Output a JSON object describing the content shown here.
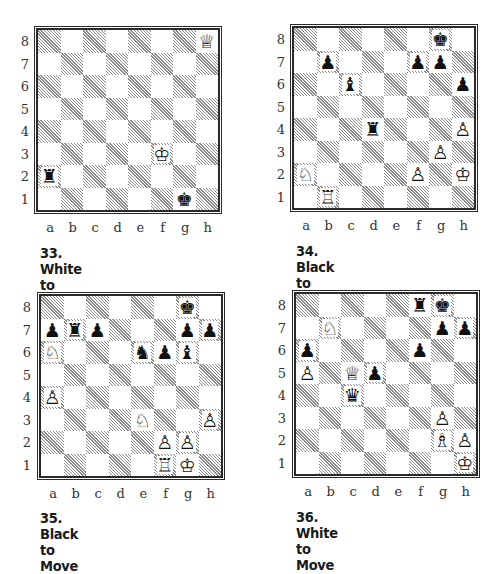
{
  "file_labels": [
    "a",
    "b",
    "c",
    "d",
    "e",
    "f",
    "g",
    "h"
  ],
  "rank_labels": [
    "8",
    "7",
    "6",
    "5",
    "4",
    "3",
    "2",
    "1"
  ],
  "diagrams": [
    {
      "number": "33",
      "caption": "33. White to Move",
      "to_move": "White",
      "pieces": [
        {
          "square": "h8",
          "color": "white",
          "type": "queen"
        },
        {
          "square": "f3",
          "color": "white",
          "type": "king"
        },
        {
          "square": "a2",
          "color": "black",
          "type": "rook"
        },
        {
          "square": "g1",
          "color": "black",
          "type": "king"
        }
      ]
    },
    {
      "number": "34",
      "caption": "34. Black to Move",
      "to_move": "Black",
      "pieces": [
        {
          "square": "g8",
          "color": "black",
          "type": "king"
        },
        {
          "square": "b7",
          "color": "black",
          "type": "pawn"
        },
        {
          "square": "f7",
          "color": "black",
          "type": "pawn"
        },
        {
          "square": "g7",
          "color": "black",
          "type": "pawn"
        },
        {
          "square": "c6",
          "color": "black",
          "type": "bishop"
        },
        {
          "square": "h6",
          "color": "black",
          "type": "pawn"
        },
        {
          "square": "d4",
          "color": "black",
          "type": "rook"
        },
        {
          "square": "h4",
          "color": "white",
          "type": "pawn"
        },
        {
          "square": "g3",
          "color": "white",
          "type": "pawn"
        },
        {
          "square": "a2",
          "color": "white",
          "type": "knight"
        },
        {
          "square": "f2",
          "color": "white",
          "type": "pawn"
        },
        {
          "square": "h2",
          "color": "white",
          "type": "king"
        },
        {
          "square": "b1",
          "color": "white",
          "type": "rook"
        }
      ]
    },
    {
      "number": "35",
      "caption": "35. Black to Move",
      "to_move": "Black",
      "pieces": [
        {
          "square": "g8",
          "color": "black",
          "type": "king"
        },
        {
          "square": "a7",
          "color": "black",
          "type": "pawn"
        },
        {
          "square": "b7",
          "color": "black",
          "type": "rook"
        },
        {
          "square": "c7",
          "color": "black",
          "type": "pawn"
        },
        {
          "square": "g7",
          "color": "black",
          "type": "pawn"
        },
        {
          "square": "h7",
          "color": "black",
          "type": "pawn"
        },
        {
          "square": "a6",
          "color": "white",
          "type": "knight"
        },
        {
          "square": "e6",
          "color": "black",
          "type": "knight"
        },
        {
          "square": "f6",
          "color": "black",
          "type": "pawn"
        },
        {
          "square": "g6",
          "color": "black",
          "type": "bishop"
        },
        {
          "square": "a4",
          "color": "white",
          "type": "pawn"
        },
        {
          "square": "e3",
          "color": "white",
          "type": "knight"
        },
        {
          "square": "h3",
          "color": "white",
          "type": "pawn"
        },
        {
          "square": "f2",
          "color": "white",
          "type": "pawn"
        },
        {
          "square": "g2",
          "color": "white",
          "type": "pawn"
        },
        {
          "square": "f1",
          "color": "white",
          "type": "rook"
        },
        {
          "square": "g1",
          "color": "white",
          "type": "king"
        }
      ]
    },
    {
      "number": "36",
      "caption": "36. White to Move",
      "to_move": "White",
      "pieces": [
        {
          "square": "f8",
          "color": "black",
          "type": "rook"
        },
        {
          "square": "g8",
          "color": "black",
          "type": "king"
        },
        {
          "square": "b7",
          "color": "white",
          "type": "knight"
        },
        {
          "square": "g7",
          "color": "black",
          "type": "pawn"
        },
        {
          "square": "h7",
          "color": "black",
          "type": "pawn"
        },
        {
          "square": "a6",
          "color": "black",
          "type": "pawn"
        },
        {
          "square": "f6",
          "color": "black",
          "type": "pawn"
        },
        {
          "square": "a5",
          "color": "white",
          "type": "pawn"
        },
        {
          "square": "c5",
          "color": "white",
          "type": "queen"
        },
        {
          "square": "d5",
          "color": "black",
          "type": "pawn"
        },
        {
          "square": "c4",
          "color": "black",
          "type": "queen"
        },
        {
          "square": "g3",
          "color": "white",
          "type": "pawn"
        },
        {
          "square": "g2",
          "color": "white",
          "type": "bishop"
        },
        {
          "square": "h2",
          "color": "white",
          "type": "pawn"
        },
        {
          "square": "h1",
          "color": "white",
          "type": "king"
        }
      ]
    }
  ],
  "glyphs": {
    "white": {
      "king": "♔",
      "queen": "♕",
      "rook": "♖",
      "bishop": "♗",
      "knight": "♘",
      "pawn": "♙"
    },
    "black": {
      "king": "♚",
      "queen": "♛",
      "rook": "♜",
      "bishop": "♝",
      "knight": "♞",
      "pawn": "♟"
    }
  }
}
